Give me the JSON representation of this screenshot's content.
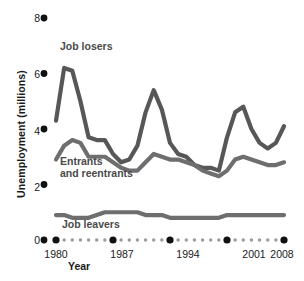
{
  "chart_data": {
    "type": "line",
    "title": "",
    "xlabel": "Year",
    "ylabel": "Unemployment (millions)",
    "xlim": [
      1980,
      2008
    ],
    "ylim": [
      0,
      8
    ],
    "yticks": [
      0,
      2,
      4,
      6,
      8
    ],
    "xticks": [
      1980,
      1987,
      1994,
      2001,
      2008
    ],
    "grid": false,
    "legend_position": "inline-annotations",
    "x": [
      1980,
      1981,
      1982,
      1983,
      1984,
      1985,
      1986,
      1987,
      1988,
      1989,
      1990,
      1991,
      1992,
      1993,
      1994,
      1995,
      1996,
      1997,
      1998,
      1999,
      2000,
      2001,
      2002,
      2003,
      2004,
      2005,
      2006,
      2007,
      2008
    ],
    "series": [
      {
        "name": "Job losers",
        "color": "#575757",
        "values": [
          4.3,
          6.2,
          6.1,
          5.0,
          3.7,
          3.6,
          3.6,
          3.1,
          2.8,
          2.9,
          3.4,
          4.6,
          5.4,
          4.7,
          3.5,
          3.1,
          3.0,
          2.7,
          2.6,
          2.6,
          2.5,
          3.7,
          4.6,
          4.8,
          4.0,
          3.5,
          3.3,
          3.5,
          4.1
        ]
      },
      {
        "name": "Entrants and reentrants",
        "color": "#6e6e6e",
        "values": [
          2.9,
          3.4,
          3.6,
          3.5,
          3.0,
          3.0,
          3.0,
          2.8,
          2.6,
          2.5,
          2.5,
          2.8,
          3.1,
          3.0,
          2.9,
          2.9,
          2.8,
          2.7,
          2.5,
          2.4,
          2.3,
          2.5,
          2.9,
          3.0,
          2.9,
          2.8,
          2.7,
          2.7,
          2.8
        ]
      },
      {
        "name": "Job leavers",
        "color": "#6e6e6e",
        "values": [
          0.9,
          0.9,
          0.8,
          0.8,
          0.8,
          0.9,
          1.0,
          1.0,
          1.0,
          1.0,
          1.0,
          0.9,
          0.9,
          0.9,
          0.8,
          0.8,
          0.8,
          0.8,
          0.8,
          0.8,
          0.8,
          0.9,
          0.9,
          0.9,
          0.9,
          0.9,
          0.9,
          0.9,
          0.9
        ]
      }
    ],
    "annotations": [
      {
        "text": "Job losers",
        "x_px": 60,
        "y_px": 45
      },
      {
        "text": "Entrants",
        "x_px": 60,
        "y_px": 159
      },
      {
        "text": "and reentrants",
        "x_px": 60,
        "y_px": 171
      },
      {
        "text": "Job leavers",
        "x_px": 62,
        "y_px": 222
      }
    ]
  },
  "axis": {
    "y_tick_labels": [
      "8",
      "6",
      "4",
      "2",
      "0"
    ],
    "x_tick_labels": [
      "1980",
      "1987",
      "1994",
      "2001",
      "2008"
    ],
    "x_title": "Year",
    "y_title": "Unemployment (millions)"
  }
}
